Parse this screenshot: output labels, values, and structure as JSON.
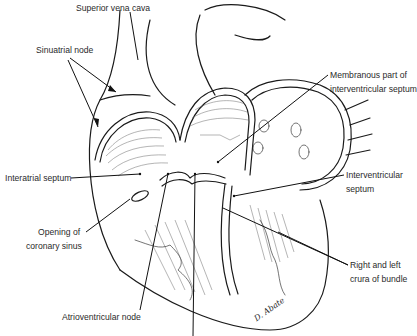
{
  "figure": {
    "background": "#ffffff",
    "ink_color": "#1a1a1a",
    "signature": "D. Abate"
  },
  "labels": {
    "superior_vena_cava": "Superior vena cava",
    "sinuatrial_node": "Sinuatrial node",
    "membranous_part_line1": "Membranous part of",
    "membranous_part_line2": "interventricular septum",
    "interatrial_septum": "Interatrial septum",
    "interventricular_septum_line1": "Interventricular",
    "interventricular_septum_line2": "septum",
    "coronary_sinus_line1": "Opening of",
    "coronary_sinus_line2": "coronary sinus",
    "crura_line1": "Right and left",
    "crura_line2": "crura of bundle",
    "atrioventricular_node": "Atrioventricular node"
  }
}
